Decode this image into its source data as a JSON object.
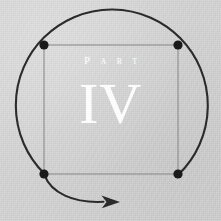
{
  "page": {
    "kind": "book-part-divider",
    "width": 221,
    "height": 221,
    "background_color": "#d2d2d2"
  },
  "heading": {
    "label": "Part",
    "number": "IV",
    "text_color": "#ffffff"
  },
  "figure": {
    "name": "circle-square-cycle-diagram",
    "stroke_color_circle": "#2b2b2b",
    "stroke_color_square": "#8a8a8a",
    "dot_color": "#1a1a1a",
    "arrow_color": "#2b2b2b",
    "circle": {
      "cx": 111,
      "cy": 110,
      "r": 96,
      "stroke_width": 2
    },
    "square": {
      "x": 44,
      "y": 45,
      "width": 134,
      "height": 129,
      "stroke_width": 1
    },
    "nodes": [
      {
        "name": "node-top-left",
        "cx": 44,
        "cy": 45,
        "r": 4.6
      },
      {
        "name": "node-top-right",
        "cx": 178,
        "cy": 45,
        "r": 4.6
      },
      {
        "name": "node-bottom-right",
        "cx": 178,
        "cy": 174,
        "r": 4.6
      },
      {
        "name": "node-bottom-left",
        "cx": 44,
        "cy": 174,
        "r": 4.6
      }
    ],
    "arc_path": "M 178.5 174.5 A 96 96 0 1 0 44.5 173.5",
    "arrow_tail_path": "M 45 175 C 52 192 74 203 104 202",
    "arrow_head_points": "104,196.5 120,202 104,207.5 108,202",
    "direction": "counterclockwise"
  }
}
